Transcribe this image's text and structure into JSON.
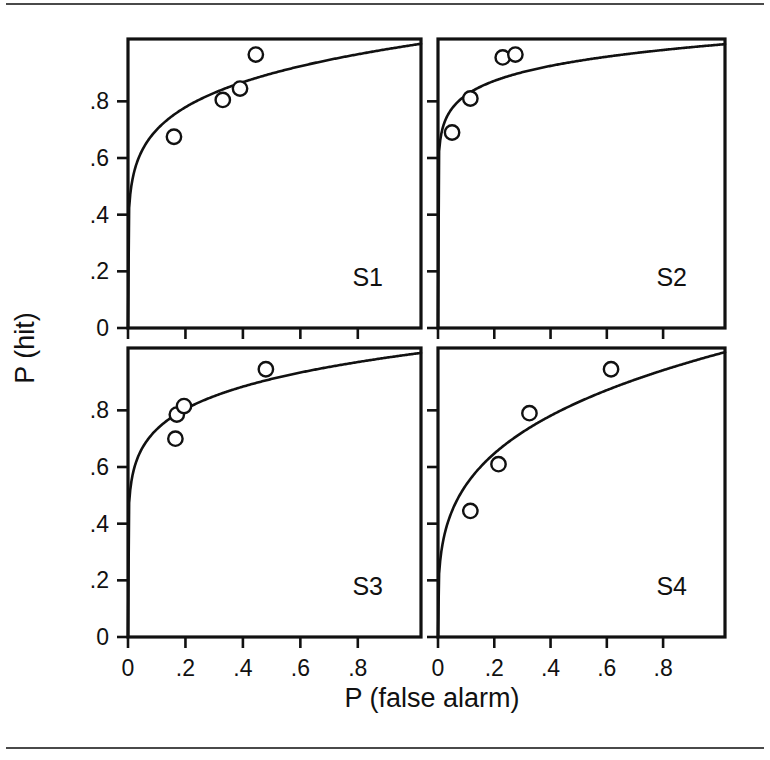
{
  "figure": {
    "title": "",
    "x_axis_title": "P (false alarm)",
    "y_axis_title": "P (hit)",
    "x_tick_labels": [
      "0",
      ".2",
      ".4",
      ".6",
      ".8"
    ],
    "y_tick_labels": [
      "0",
      ".2",
      ".4",
      ".6",
      ".8"
    ],
    "panel_labels": [
      "S1",
      "S2",
      "S3",
      "S4"
    ],
    "line_color": "#111111",
    "marker_fill": "#ffffff",
    "background": "#ffffff"
  },
  "chart_data": [
    {
      "type": "scatter",
      "title": "S1",
      "xlabel": "P (false alarm)",
      "ylabel": "P (hit)",
      "xlim": [
        0,
        1
      ],
      "ylim": [
        0,
        1
      ],
      "xticks": [
        0,
        0.2,
        0.4,
        0.6,
        0.8
      ],
      "yticks": [
        0,
        0.2,
        0.4,
        0.6,
        0.8
      ],
      "grid": false,
      "legend": "none",
      "series": [
        {
          "name": "S1 observed",
          "marker": "open-circle",
          "x": [
            0.16,
            0.33,
            0.39,
            0.445
          ],
          "y": [
            0.675,
            0.805,
            0.845,
            0.965
          ]
        },
        {
          "name": "S1 fitted ROC",
          "marker": "none",
          "curve_params": {
            "d_prime": 1.88,
            "shape": "power",
            "exponent": 0.155
          }
        }
      ]
    },
    {
      "type": "scatter",
      "title": "S2",
      "xlabel": "P (false alarm)",
      "ylabel": "P (hit)",
      "xlim": [
        0,
        1
      ],
      "ylim": [
        0,
        1
      ],
      "xticks": [
        0,
        0.2,
        0.4,
        0.6,
        0.8
      ],
      "yticks": [
        0,
        0.2,
        0.4,
        0.6,
        0.8
      ],
      "grid": false,
      "legend": "none",
      "series": [
        {
          "name": "S2 observed",
          "marker": "open-circle",
          "x": [
            0.05,
            0.115,
            0.23,
            0.275
          ],
          "y": [
            0.69,
            0.81,
            0.955,
            0.965
          ]
        },
        {
          "name": "S2 fitted ROC",
          "marker": "none",
          "curve_params": {
            "d_prime": 2.65,
            "shape": "power",
            "exponent": 0.085
          }
        }
      ]
    },
    {
      "type": "scatter",
      "title": "S3",
      "xlabel": "P (false alarm)",
      "ylabel": "P (hit)",
      "xlim": [
        0,
        1
      ],
      "ylim": [
        0,
        1
      ],
      "xticks": [
        0,
        0.2,
        0.4,
        0.6,
        0.8
      ],
      "yticks": [
        0,
        0.2,
        0.4,
        0.6,
        0.8
      ],
      "grid": false,
      "legend": "none",
      "series": [
        {
          "name": "S3 observed",
          "marker": "open-circle",
          "x": [
            0.165,
            0.17,
            0.195,
            0.48
          ],
          "y": [
            0.7,
            0.785,
            0.815,
            0.945
          ]
        },
        {
          "name": "S3 fitted ROC",
          "marker": "none",
          "curve_params": {
            "d_prime": 2.0,
            "shape": "power",
            "exponent": 0.135
          }
        }
      ]
    },
    {
      "type": "scatter",
      "title": "S4",
      "xlabel": "P (false alarm)",
      "ylabel": "P (hit)",
      "xlim": [
        0,
        1
      ],
      "ylim": [
        0,
        1
      ],
      "xticks": [
        0,
        0.2,
        0.4,
        0.6,
        0.8
      ],
      "yticks": [
        0,
        0.2,
        0.4,
        0.6,
        0.8
      ],
      "grid": false,
      "legend": "none",
      "series": [
        {
          "name": "S4 observed",
          "marker": "open-circle",
          "x": [
            0.115,
            0.215,
            0.325,
            0.615
          ],
          "y": [
            0.445,
            0.61,
            0.79,
            0.945
          ]
        },
        {
          "name": "S4 fitted ROC",
          "marker": "none",
          "curve_params": {
            "d_prime": 1.25,
            "shape": "power",
            "exponent": 0.27
          }
        }
      ]
    }
  ]
}
